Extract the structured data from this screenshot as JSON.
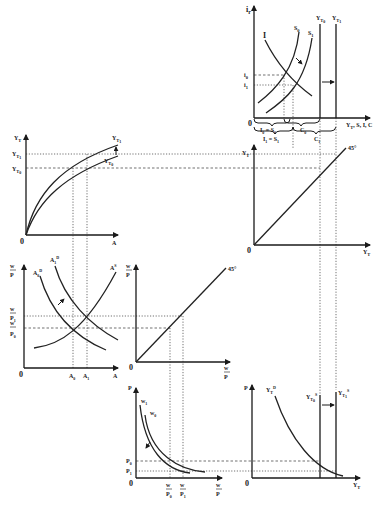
{
  "diagram": {
    "title": "",
    "panels": {
      "investment_saving": {
        "y_axis_label": "i",
        "y_axis_sub": "r",
        "x_axis_label": "Y_T, S, I, C",
        "curves": [
          "I",
          "S0",
          "S1",
          "Y_T0",
          "Y_T1"
        ],
        "ticks_y": [
          "i0",
          "i1"
        ],
        "brace_labels": [
          "I0 = S0",
          "C0",
          "I1 = S1",
          "C1"
        ],
        "origin": "0"
      },
      "production": {
        "y_axis_label": "Y_T",
        "x_axis_label": "A",
        "curves": [
          "Y_T1",
          "Y_T0"
        ],
        "ticks_y": [
          "Y_T1",
          "Y_T0"
        ],
        "origin": "0"
      },
      "forty_five_top": {
        "y_axis_label": "Y_T",
        "x_axis_label": "Y_T",
        "line_label": "45°",
        "origin": "0"
      },
      "labor_market": {
        "y_axis_label": "w/P",
        "x_axis_label": "A",
        "curves": [
          "A0^D",
          "A1^D",
          "A^S"
        ],
        "ticks_y": [
          "w/P1",
          "w/P0"
        ],
        "ticks_x": [
          "A0",
          "A1"
        ],
        "origin": "0"
      },
      "forty_five_mid": {
        "y_axis_label": "w/P",
        "x_axis_label": "w/P",
        "line_label": "45°",
        "origin": "0"
      },
      "price_wage": {
        "y_axis_label": "P",
        "x_axis_label": "w/P",
        "curves": [
          "w1",
          "w0"
        ],
        "ticks_y": [
          "P0",
          "P1"
        ],
        "ticks_x": [
          "w/P0",
          "w/P1"
        ],
        "origin": "0"
      },
      "aggregate_supply": {
        "y_axis_label": "P",
        "x_axis_label": "Y_T",
        "curves": [
          "Y_T^D",
          "Y_T0^S",
          "Y_T1^S"
        ],
        "origin": "0"
      }
    }
  },
  "labels": {
    "zero": "0",
    "i": "i",
    "r": "r",
    "I": "I",
    "S": "S",
    "Y": "Y",
    "T": "T",
    "A": "A",
    "P": "P",
    "w": "w",
    "C": "C",
    "deg45": "45°",
    "sub0": "0",
    "sub1": "1",
    "supD": "D",
    "supS": "S",
    "xaxis_tr": "Y",
    "xaxis_tr_rest": ", S, I, C",
    "eq": " = ",
    "A0": "A",
    "A1": "A"
  }
}
